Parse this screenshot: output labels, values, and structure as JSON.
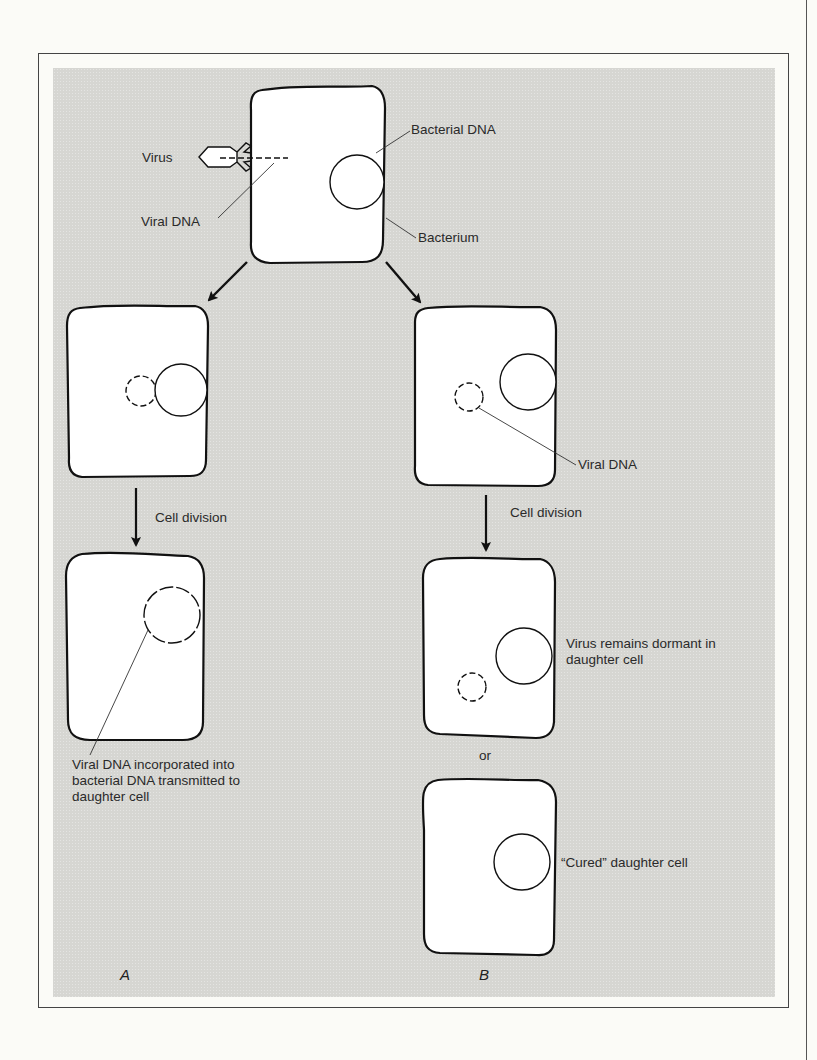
{
  "figure": {
    "panel_labels": [
      "A",
      "B"
    ],
    "colors": {
      "panel_background": "#d6d6d2",
      "cell_fill": "#ffffff",
      "outline": "#111111",
      "label_text": "#2a2a2a"
    }
  },
  "top": {
    "labels": {
      "virus": "Virus",
      "viral_dna": "Viral DNA",
      "bacterial_dna": "Bacterial DNA",
      "bacterium": "Bacterium"
    }
  },
  "branch_a": {
    "division_label": "Cell division",
    "daughter_caption": "Viral DNA incorporated into bacterial DNA transmitted to daughter cell",
    "panel_letter": "A"
  },
  "branch_b": {
    "viral_dna_label": "Viral DNA",
    "division_label": "Cell division",
    "dormant_caption": "Virus remains dormant in daughter cell",
    "or_label": "or",
    "cured_caption": "“Cured” daughter cell",
    "panel_letter": "B"
  }
}
